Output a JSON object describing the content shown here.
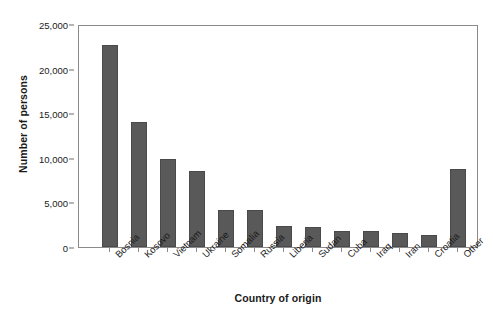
{
  "chart_data": {
    "type": "bar",
    "title": "",
    "xlabel": "Country of origin",
    "ylabel": "Number of persons",
    "categories": [
      "Bosnia",
      "Kosovo",
      "Vietnam",
      "Ukraine",
      "Somalia",
      "Russia",
      "Liberia",
      "Sudan",
      "Cuba",
      "Iraq",
      "Iran",
      "Croatia",
      "Other"
    ],
    "values": [
      22600,
      14000,
      9900,
      8500,
      4200,
      4100,
      2350,
      2200,
      1850,
      1750,
      1550,
      1400,
      8700
    ],
    "ylim": [
      0,
      25000
    ],
    "ytick_values": [
      0,
      5000,
      10000,
      15000,
      20000,
      25000
    ],
    "ytick_labels": [
      "0",
      "5,000",
      "10,000",
      "15,000",
      "20,000",
      "25,000"
    ],
    "grid": false,
    "legend": null,
    "bar_color": "#595959",
    "frame_color": "#8a8a8a",
    "background_color": "#ffffff"
  }
}
